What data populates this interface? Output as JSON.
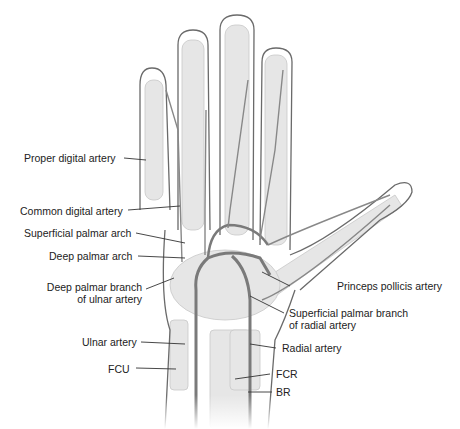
{
  "figure": {
    "labels": {
      "proper_digital_artery": "Proper digital artery",
      "common_digital_artery": "Common digital artery",
      "superficial_palmar_arch": "Superficial palmar arch",
      "deep_palmar_arch": "Deep palmar arch",
      "deep_palmar_branch_ulnar_1": "Deep palmar branch",
      "deep_palmar_branch_ulnar_2": "of ulnar artery",
      "ulnar_artery": "Ulnar artery",
      "fcu": "FCU",
      "princeps_pollicis_artery": "Princeps pollicis artery",
      "superficial_palmar_branch_radial_1": "Superficial palmar branch",
      "superficial_palmar_branch_radial_2": "of radial artery",
      "radial_artery": "Radial artery",
      "fcr": "FCR",
      "br": "BR"
    },
    "colors": {
      "artery": "#7a7a7a",
      "outline": "#6a6a6a",
      "bone": "#e4e4e4",
      "leader": "#333333"
    }
  }
}
